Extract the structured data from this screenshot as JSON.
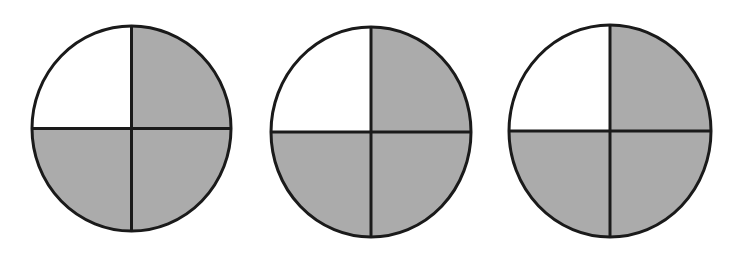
{
  "figure": {
    "background_color": "#ffffff",
    "canvas": {
      "width": 744,
      "height": 255
    }
  },
  "style": {
    "shaded_fill": "#ababab",
    "unshaded_fill": "#ffffff",
    "outline_color": "#1a1a1a",
    "outline_width": 3,
    "divider_color": "#1a1a1a",
    "divider_width": 3
  },
  "chart_data": {
    "type": "pie",
    "xlabel": "",
    "ylabel": "",
    "legend": [
      {
        "label": "shaded",
        "color": "#ababab"
      },
      {
        "label": "unshaded",
        "color": "#ffffff"
      }
    ],
    "legend_position": "none",
    "grid": false,
    "shared_categories": [
      "upper-left quadrant",
      "upper-right quadrant",
      "lower-right quadrant",
      "lower-left quadrant"
    ],
    "series": [
      {
        "name": "circle 1",
        "values": [
          25,
          25,
          25,
          25
        ],
        "states": [
          "unshaded",
          "shaded",
          "shaded",
          "shaded"
        ],
        "shaded_count": 3,
        "total_parts": 4,
        "fraction_shaded": "3/4"
      },
      {
        "name": "circle 2",
        "values": [
          25,
          25,
          25,
          25
        ],
        "states": [
          "unshaded",
          "shaded",
          "shaded",
          "shaded"
        ],
        "shaded_count": 3,
        "total_parts": 4,
        "fraction_shaded": "3/4"
      },
      {
        "name": "circle 3",
        "values": [
          25,
          25,
          25,
          25
        ],
        "states": [
          "unshaded",
          "shaded",
          "shaded",
          "shaded"
        ],
        "shaded_count": 3,
        "total_parts": 4,
        "fraction_shaded": "3/4"
      }
    ]
  },
  "circles": [
    {
      "id": "circle-1",
      "label": "1",
      "left": 29,
      "top": 23,
      "width": 205,
      "height": 211,
      "cx": 102.5,
      "cy": 105.5,
      "rx": 101,
      "ry": 104,
      "quadrants": [
        {
          "name": "upper-left",
          "state": "unshaded"
        },
        {
          "name": "upper-right",
          "state": "shaded"
        },
        {
          "name": "lower-right",
          "state": "shaded"
        },
        {
          "name": "lower-left",
          "state": "shaded"
        }
      ]
    },
    {
      "id": "circle-2",
      "label": "2",
      "left": 268,
      "top": 24,
      "width": 206,
      "height": 216,
      "cx": 103,
      "cy": 108,
      "rx": 101.5,
      "ry": 106.5,
      "quadrants": [
        {
          "name": "upper-left",
          "state": "unshaded"
        },
        {
          "name": "upper-right",
          "state": "shaded"
        },
        {
          "name": "lower-right",
          "state": "shaded"
        },
        {
          "name": "lower-left",
          "state": "shaded"
        }
      ]
    },
    {
      "id": "circle-3",
      "label": "3",
      "left": 506,
      "top": 22,
      "width": 208,
      "height": 218,
      "cx": 104,
      "cy": 109,
      "rx": 102.5,
      "ry": 107.5,
      "quadrants": [
        {
          "name": "upper-left",
          "state": "unshaded"
        },
        {
          "name": "upper-right",
          "state": "shaded"
        },
        {
          "name": "lower-right",
          "state": "shaded"
        },
        {
          "name": "lower-left",
          "state": "shaded"
        }
      ]
    }
  ]
}
